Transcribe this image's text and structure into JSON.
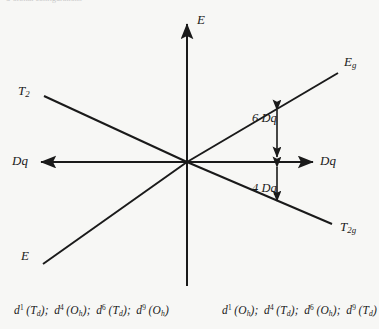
{
  "page": {
    "header_fragment": "d-orbital configurations",
    "background_color": "#f7f7f5",
    "ink_color": "#1a1a1a"
  },
  "axes": {
    "energy_axis_label": "E",
    "baseline_label_left": "Dq",
    "baseline_label_right": "Dq"
  },
  "states": {
    "upper_left": {
      "term": "T",
      "sub": "2"
    },
    "lower_left": {
      "term": "E",
      "sub": ""
    },
    "upper_right": {
      "term": "E",
      "sub": "g"
    },
    "lower_right": {
      "term": "T",
      "sub": "2g"
    }
  },
  "splittings": {
    "upper": {
      "value": "6",
      "unit": "Dq",
      "text": "6 Dq"
    },
    "lower": {
      "value": "4",
      "unit": "Dq",
      "text": "4 Dq"
    }
  },
  "captions": {
    "left": [
      {
        "d": "d",
        "sup": "1",
        "field": "T",
        "fieldsub": "d"
      },
      {
        "d": "d",
        "sup": "4",
        "field": "O",
        "fieldsub": "h"
      },
      {
        "d": "d",
        "sup": "6",
        "field": "T",
        "fieldsub": "d"
      },
      {
        "d": "d",
        "sup": "9",
        "field": "O",
        "fieldsub": "h"
      }
    ],
    "right": [
      {
        "d": "d",
        "sup": "1",
        "field": "O",
        "fieldsub": "h"
      },
      {
        "d": "d",
        "sup": "4",
        "field": "T",
        "fieldsub": "d"
      },
      {
        "d": "d",
        "sup": "6",
        "field": "O",
        "fieldsub": "h"
      },
      {
        "d": "d",
        "sup": "9",
        "field": "T",
        "fieldsub": "d"
      }
    ],
    "separator": ";"
  },
  "chart_data": {
    "type": "line",
    "xlabel": "Dq",
    "ylabel": "E",
    "origin": {
      "x": 0,
      "y": 0
    },
    "series": [
      {
        "name": "T2",
        "side": "left",
        "points": [
          [
            -1,
            0.62
          ],
          [
            0,
            0
          ]
        ]
      },
      {
        "name": "E",
        "side": "left",
        "points": [
          [
            0,
            0
          ],
          [
            -1,
            -0.72
          ]
        ]
      },
      {
        "name": "Eg",
        "side": "right",
        "points": [
          [
            0,
            0
          ],
          [
            1,
            0.6
          ]
        ]
      },
      {
        "name": "T2g",
        "side": "right",
        "points": [
          [
            0,
            0
          ],
          [
            1,
            -0.43
          ]
        ]
      }
    ],
    "annotations": [
      {
        "text": "6 Dq",
        "value": 6,
        "unit": "Dq",
        "position": "upper-right"
      },
      {
        "text": "4 Dq",
        "value": 4,
        "unit": "Dq",
        "position": "lower-right"
      }
    ],
    "grid": false,
    "legend": false
  }
}
